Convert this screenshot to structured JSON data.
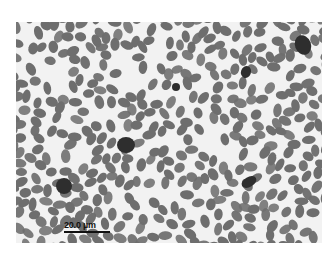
{
  "image": {
    "subject": "blood smear micrograph with oval erythrocytes",
    "background_color": "#f2f2f2",
    "cell_color": "#6e6e6e",
    "nucleated_cell_color": "#2e2e2e"
  },
  "scale_bar": {
    "label": "20.0 µm"
  },
  "nucleated_cells": [
    {
      "cx": 110,
      "cy": 123,
      "rx": 9,
      "ry": 8,
      "rot": 0
    },
    {
      "cx": 48,
      "cy": 164,
      "rx": 8,
      "ry": 8,
      "rot": 0
    },
    {
      "cx": 287,
      "cy": 23,
      "rx": 8,
      "ry": 10,
      "rot": -20
    },
    {
      "cx": 233,
      "cy": 160,
      "rx": 8,
      "ry": 5,
      "rot": -30
    },
    {
      "cx": 230,
      "cy": 50,
      "rx": 5,
      "ry": 6,
      "rot": 20
    },
    {
      "cx": 160,
      "cy": 65,
      "rx": 4,
      "ry": 4,
      "rot": 0
    }
  ]
}
